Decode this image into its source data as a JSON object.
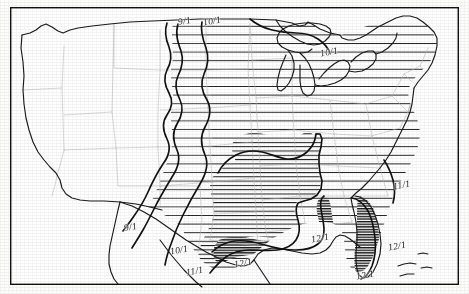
{
  "map": {
    "title": "Average date of first freeze, contiguous United States",
    "region": "Contiguous United States",
    "projection_note": "conic",
    "frame_color": "#111111",
    "background_color": "#ffffff",
    "coastline_color": "#1a1a1a",
    "state_border_color": "#b8b8b8",
    "contour_color": "#111111",
    "hatch_color": "#2a2a2a"
  },
  "legend_note": "Isolines labeled with month/day of average first freeze date",
  "contour_labels": [
    {
      "id": "lbl-9-1-north",
      "text": "9/1",
      "x": 178,
      "y": 16,
      "rot": -10
    },
    {
      "id": "lbl-10-1-north",
      "text": "10/1",
      "x": 203,
      "y": 16,
      "rot": -10
    },
    {
      "id": "lbl-10-1-lakes",
      "text": "10/1",
      "x": 320,
      "y": 47,
      "rot": -10
    },
    {
      "id": "lbl-9-1-southwest",
      "text": "9/1",
      "x": 124,
      "y": 222,
      "rot": -10
    },
    {
      "id": "lbl-10-1-texas",
      "text": "10/1",
      "x": 170,
      "y": 245,
      "rot": -10
    },
    {
      "id": "lbl-11-1-texas",
      "text": "11/1",
      "x": 186,
      "y": 266,
      "rot": -10
    },
    {
      "id": "lbl-12-1-gulf",
      "text": "12/1",
      "x": 234,
      "y": 258,
      "rot": -10
    },
    {
      "id": "lbl-12-1-louisiana",
      "text": "12/1",
      "x": 311,
      "y": 233,
      "rot": -10
    },
    {
      "id": "lbl-11-1-carolina",
      "text": "11/1",
      "x": 393,
      "y": 180,
      "rot": -10
    },
    {
      "id": "lbl-12-1-florida-n",
      "text": "12/1",
      "x": 388,
      "y": 241,
      "rot": -10
    },
    {
      "id": "lbl-12-1-florida-s",
      "text": "12/1",
      "x": 356,
      "y": 270,
      "rot": -10
    }
  ],
  "chart_data": {
    "type": "map",
    "isoline_values": [
      "9/1",
      "10/1",
      "11/1",
      "12/1"
    ],
    "zones": [
      {
        "name": "before 9/1",
        "hatch_density": "none",
        "description": "Western mountains and Pacific coast, unhatched"
      },
      {
        "name": "9/1 to 10/1",
        "hatch_density": "light",
        "description": "Northern plains band"
      },
      {
        "name": "10/1 to 11/1",
        "hatch_density": "medium",
        "description": "Central and eastern states"
      },
      {
        "name": "11/1 to 12/1",
        "hatch_density": "dense",
        "description": "Lower Mississippi valley and interior south"
      },
      {
        "name": "after 12/1",
        "hatch_density": "very dense",
        "description": "Gulf coast strip and southern Florida"
      }
    ]
  }
}
